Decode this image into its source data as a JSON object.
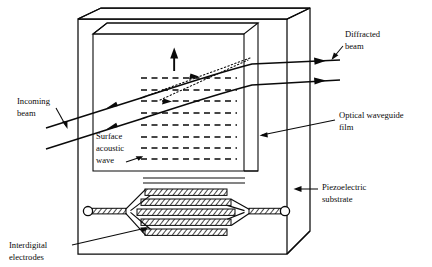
{
  "figure": {
    "background_color": "#ffffff",
    "ink_color": "#0a0a0a"
  },
  "labels": {
    "incoming_beam": {
      "line1": "Incoming",
      "line2": "beam"
    },
    "diffracted_beam": {
      "line1": "Diffracted",
      "line2": "beam"
    },
    "optical_waveguide_film": {
      "line1": "Optical waveguide",
      "line2": "film"
    },
    "piezoelectric_substrate": {
      "line1": "Piezoelectric",
      "line2": "substrate"
    },
    "surface_acoustic_wave": {
      "line1": "Surface",
      "line2": "acoustic",
      "line3": "wave"
    },
    "interdigital_electrodes": {
      "line1": "Interdigital",
      "line2": "electrodes"
    }
  },
  "components": {
    "substrate_block": "piezoelectric-substrate-block",
    "waveguide_panel": "optical-waveguide-film-panel",
    "saw_wavefronts_count": 9,
    "saw_direction_arrow": "up-arrow",
    "transducer_fingers_count": 5,
    "transducer_pads_count": 2,
    "incident_beams_count": 2,
    "diffracted_beams_count": 2,
    "dotted_construction_lines_count": 2
  },
  "geometry": {
    "width": 432,
    "height": 267
  }
}
